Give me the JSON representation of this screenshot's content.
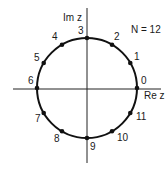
{
  "diagram": {
    "title": "N = 12",
    "axes": {
      "x_label": "Re z",
      "y_label": "Im z"
    },
    "circle": {
      "cx": 87,
      "cy": 88,
      "r": 50,
      "stroke": "#111111"
    },
    "points": [
      {
        "k": "0",
        "label": "0"
      },
      {
        "k": "1",
        "label": "1"
      },
      {
        "k": "2",
        "label": "2"
      },
      {
        "k": "3",
        "label": "3"
      },
      {
        "k": "4",
        "label": "4"
      },
      {
        "k": "5",
        "label": "5"
      },
      {
        "k": "6",
        "label": "6"
      },
      {
        "k": "7",
        "label": "7"
      },
      {
        "k": "8",
        "label": "8"
      },
      {
        "k": "9",
        "label": "9"
      },
      {
        "k": "10",
        "label": "10"
      },
      {
        "k": "11",
        "label": "11"
      }
    ]
  }
}
